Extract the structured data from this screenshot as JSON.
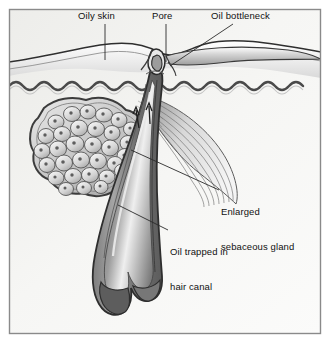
{
  "figure": {
    "frame_color": "#8a8a8a",
    "background_color": "#f7f7f6",
    "ink_color": "#1a1a1a"
  },
  "labels": {
    "oily_skin": "Oily skin",
    "pore": "Pore",
    "oil_bottleneck": "Oil bottleneck",
    "enlarged_gland_line1": "Enlarged",
    "enlarged_gland_line2": "sebaceous gland",
    "oil_trapped_line1": "Oil trapped in",
    "oil_trapped_line2": "hair canal"
  },
  "structures": {
    "epidermis": "epidermis-layer",
    "dermis": "dermis-layer",
    "dermal_junction": "wavy-dermal-epidermal-junction",
    "sebaceous_gland": "enlarged-sebaceous-gland-lobule",
    "hair_follicle": "hair-follicle-canal",
    "hair_bulb": "hair-bulb",
    "arrector_pili": "arrector-pili-muscle",
    "oil_flow_arrows": "oil-flow-arrows"
  },
  "colors": {
    "gland_outline": "#4a4a4a",
    "gland_fill": "#c9c9c9",
    "follicle_wall": "#6e6e6e",
    "follicle_core": "#8d8d8d",
    "muscle": "#b9b9b9",
    "skin_surface": "#5a5a5a"
  }
}
